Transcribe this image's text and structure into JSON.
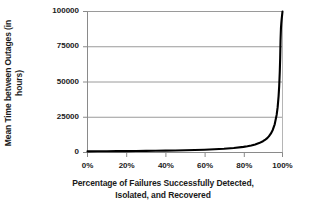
{
  "chart_data": {
    "type": "line",
    "title": "",
    "xlabel": "Percentage of Failures Successfully Detected, Isolated, and Recovered",
    "ylabel": "Mean Time between Outages (in hours)",
    "ylabel_lines": [
      "Mean Time between Outages (in",
      "hours)"
    ],
    "xlabel_lines": [
      "Percentage of Failures Successfully Detected,",
      "Isolated, and Recovered"
    ],
    "xlim": [
      0,
      100
    ],
    "ylim": [
      0,
      100000
    ],
    "grid": "horizontal",
    "legend": "none",
    "line_color": "#000000",
    "gridline_color": "#999999",
    "axis_color": "#808080",
    "xticks": [
      0,
      20,
      40,
      60,
      80,
      100
    ],
    "xtick_labels": [
      "0%",
      "20%",
      "40%",
      "60%",
      "80%",
      "100%"
    ],
    "yticks": [
      0,
      25000,
      50000,
      75000,
      100000
    ],
    "ytick_labels": [
      "0",
      "25000",
      "50000",
      "75000",
      "100000"
    ],
    "series": [
      {
        "name": "Mean Time between Outages",
        "x": [
          0,
          5,
          10,
          15,
          20,
          25,
          30,
          35,
          40,
          45,
          50,
          55,
          60,
          65,
          70,
          75,
          80,
          82,
          84,
          86,
          88,
          90,
          91,
          92,
          93,
          94,
          95,
          96,
          97,
          97.5,
          98,
          98.3,
          98.6,
          98.8,
          99,
          99.2,
          99.4,
          99.6,
          99.8,
          99.9,
          100
        ],
        "values": [
          800,
          840,
          890,
          940,
          1000,
          1070,
          1140,
          1230,
          1330,
          1450,
          1600,
          1780,
          2000,
          2290,
          2670,
          3200,
          4000,
          4440,
          5000,
          5710,
          6670,
          8000,
          8890,
          10000,
          11430,
          13330,
          16000,
          20000,
          26670,
          32000,
          40000,
          47060,
          57140,
          66670,
          80000,
          88000,
          92000,
          95000,
          97500,
          98800,
          100000
        ]
      }
    ]
  }
}
